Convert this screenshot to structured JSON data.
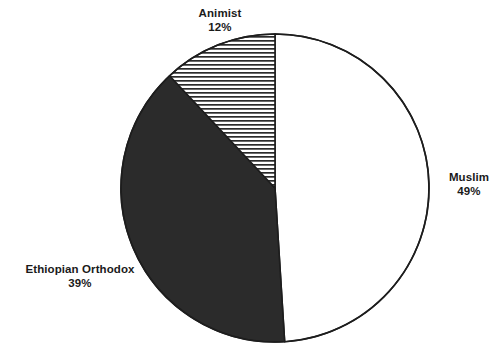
{
  "chart_data": {
    "type": "pie",
    "title": "",
    "subtitle": "",
    "xlabel": "",
    "ylabel": "",
    "legend_position": "none",
    "grid": false,
    "labels": [
      "Muslim",
      "Ethiopian Orthodox",
      "Animist"
    ],
    "values": [
      49,
      39,
      12
    ],
    "value_suffix": "%",
    "slices": [
      {
        "name": "Muslim",
        "value": 49,
        "value_label": "49%",
        "fill_style": "solid-white",
        "fill_color": "#ffffff",
        "start_angle_deg": 0,
        "end_angle_deg": 176.4
      },
      {
        "name": "Ethiopian Orthodox",
        "value": 39,
        "value_label": "39%",
        "fill_style": "solid-dark",
        "fill_color": "#2b2b2b",
        "start_angle_deg": 176.4,
        "end_angle_deg": 316.8
      },
      {
        "name": "Animist",
        "value": 12,
        "value_label": "12%",
        "fill_style": "horizontal-hatch",
        "fill_color": "#ffffff",
        "hatch_color": "#2b2b2b",
        "start_angle_deg": 316.8,
        "end_angle_deg": 360
      }
    ]
  },
  "labels": {
    "animist": {
      "name": "Animist",
      "value": "12%"
    },
    "muslim": {
      "name": "Muslim",
      "value": "49%"
    },
    "orthodox": {
      "name": "Ethiopian Orthodox",
      "value": "39%"
    }
  },
  "style": {
    "outline_color": "#1d1d1d",
    "dark_fill": "#2b2b2b",
    "light_fill": "#ffffff",
    "background": "#ffffff",
    "text_color": "#1a1a1a"
  }
}
